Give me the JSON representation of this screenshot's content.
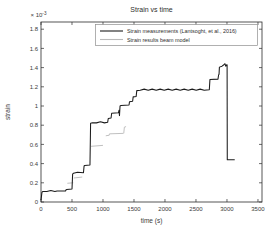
{
  "window": {
    "background": "#ffffff"
  },
  "chart_data": {
    "type": "line",
    "title": "Strain vs time",
    "xlabel": "time (s)",
    "ylabel": "strain",
    "y_multiplier": {
      "base": "× 10",
      "exp": "-3"
    },
    "y_unit_scale": "1e-3",
    "xlim": [
      0,
      3565
    ],
    "ylim": [
      0,
      1.875
    ],
    "xticks": [
      0,
      500,
      1000,
      1500,
      2000,
      2500,
      3000,
      3500
    ],
    "xtick_labels": [
      "0",
      "500",
      "1000",
      "1500",
      "2000",
      "2500",
      "3000",
      "3500"
    ],
    "yticks": [
      0,
      0.2,
      0.4,
      0.6,
      0.8,
      1.0,
      1.2,
      1.4,
      1.6,
      1.8
    ],
    "ytick_labels": [
      "0",
      "0.2",
      "0.4",
      "0.6",
      "0.8",
      "1",
      "1.2",
      "1.4",
      "1.6",
      "1.8"
    ],
    "grid": false,
    "legend_position": "top-inside",
    "axis_color": "#2b2b2b",
    "background_color": "#ffffff",
    "series": [
      {
        "name": "Strain measurements (Lantsoght, et al., 2016)",
        "color": "#1c1c1c",
        "noise": true,
        "points": [
          [
            0,
            0.02
          ],
          [
            15,
            0.1
          ],
          [
            30,
            0.11
          ],
          [
            260,
            0.115
          ],
          [
            395,
            0.115
          ],
          [
            402,
            0.125
          ],
          [
            415,
            0.13
          ],
          [
            500,
            0.135
          ],
          [
            510,
            0.29
          ],
          [
            525,
            0.3
          ],
          [
            685,
            0.305
          ],
          [
            695,
            0.375
          ],
          [
            705,
            0.38
          ],
          [
            790,
            0.385
          ],
          [
            800,
            0.82
          ],
          [
            830,
            0.825
          ],
          [
            1075,
            0.83
          ],
          [
            1085,
            0.87
          ],
          [
            1130,
            0.875
          ],
          [
            1140,
            0.925
          ],
          [
            1250,
            0.93
          ],
          [
            1258,
            0.955
          ],
          [
            1266,
            0.9
          ],
          [
            1275,
            1.0
          ],
          [
            1290,
            1.005
          ],
          [
            1420,
            1.01
          ],
          [
            1428,
            1.045
          ],
          [
            1478,
            1.05
          ],
          [
            1487,
            1.095
          ],
          [
            1535,
            1.1
          ],
          [
            1545,
            1.16
          ],
          [
            1600,
            1.165
          ],
          [
            2715,
            1.17
          ],
          [
            2725,
            1.275
          ],
          [
            2855,
            1.28
          ],
          [
            2865,
            1.325
          ],
          [
            2872,
            1.33
          ],
          [
            2878,
            1.405
          ],
          [
            2920,
            1.415
          ],
          [
            2950,
            1.43
          ],
          [
            2968,
            1.44
          ],
          [
            2980,
            1.415
          ],
          [
            2995,
            1.43
          ],
          [
            3002,
            1.43
          ],
          [
            3005,
            0.44
          ],
          [
            3125,
            0.44
          ]
        ]
      },
      {
        "name": "Strain results beam model",
        "color": "#b9b9b9",
        "noise": false,
        "segments": [
          [
            [
              425,
              0.195
            ],
            [
              520,
              0.2
            ]
          ],
          [
            [
              528,
              0.25
            ],
            [
              665,
              0.26
            ]
          ],
          [
            [
              808,
              0.58
            ],
            [
              1000,
              0.59
            ]
          ],
          [
            [
              1045,
              0.69
            ],
            [
              1100,
              0.695
            ],
            [
              1105,
              0.71
            ],
            [
              1330,
              0.715
            ]
          ],
          [
            [
              1335,
              0.715
            ],
            [
              1345,
              0.78
            ],
            [
              1372,
              0.785
            ]
          ]
        ]
      }
    ]
  }
}
